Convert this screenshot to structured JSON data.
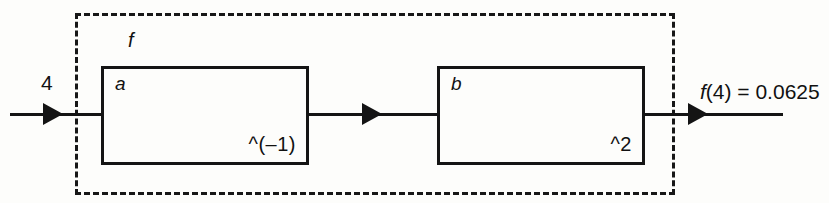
{
  "diagram": {
    "type": "function-composition-block-diagram",
    "container": {
      "label": "f",
      "style": "dashed"
    },
    "input": {
      "label": "4",
      "arrow": "arrow-right"
    },
    "blocks": [
      {
        "name": "a",
        "expression": "^(–1)"
      },
      {
        "name": "b",
        "expression": "^2"
      }
    ],
    "output": {
      "label_italic": "f",
      "label_rest": "(4) = 0.0625",
      "label_full": "f(4) = 0.0625",
      "arrow": "arrow-right"
    },
    "colors": {
      "ink": "#141414",
      "dashed_ink": "#171717",
      "background": "#fdfdfb"
    }
  }
}
